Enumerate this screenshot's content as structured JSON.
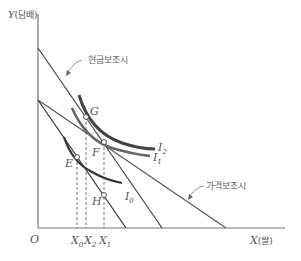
{
  "diagram": {
    "y_axis_label": "Y(담배)",
    "x_axis_label": "X(쌀)",
    "origin_label": "O",
    "annotations": {
      "cash_subsidy": "현금보조시",
      "price_subsidy": "가격보조시"
    },
    "points": {
      "E": "E",
      "F": "F",
      "G": "G",
      "H": "H"
    },
    "curves": {
      "I0": "I",
      "I0_sub": "0",
      "I1": "I",
      "I1_sub": "1",
      "I2": "I",
      "I2_sub": "2"
    },
    "x_ticks": {
      "X0": "X",
      "X0_sub": "0",
      "X2": "X",
      "X2_sub": "2",
      "X1": "X",
      "X1_sub": "1"
    },
    "colors": {
      "axis": "#777777",
      "line": "#444444",
      "curve_dark": "#333333",
      "curve_gray": "#666666"
    }
  }
}
